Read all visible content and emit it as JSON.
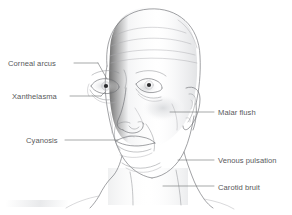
{
  "figure": {
    "background_color": "#ffffff",
    "line_color": "#6e7074",
    "text_color": "#58595b",
    "shading_color": "#e6e7e9"
  },
  "annotations": {
    "left": [
      {
        "id": "corneal-arcus",
        "label": "Corneal arcus",
        "text_x": 8,
        "text_y": 66,
        "target": "right eye (viewer left) iris rim"
      },
      {
        "id": "xanthelasma",
        "label": "Xanthelasma",
        "text_x": 12,
        "text_y": 99,
        "target": "inner lower eyelid"
      },
      {
        "id": "cyanosis",
        "label": "Cyanosis",
        "text_x": 26,
        "text_y": 143,
        "target": "lips"
      }
    ],
    "right": [
      {
        "id": "malar-flush",
        "label": "Malar flush",
        "text_x": 218,
        "text_y": 115,
        "target": "cheekbone"
      },
      {
        "id": "venous-pulsation",
        "label": "Venous pulsation",
        "text_x": 218,
        "text_y": 163,
        "target": "side of neck, jugular vein"
      },
      {
        "id": "carotid-bruit",
        "label": "Carotid bruit",
        "text_x": 218,
        "text_y": 190,
        "target": "lower neck, carotid artery"
      }
    ]
  }
}
